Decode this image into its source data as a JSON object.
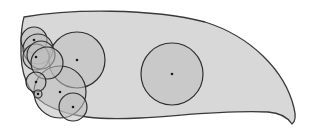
{
  "diagram": {
    "type": "cell-with-vesicles",
    "colors": {
      "background": "#ffffff",
      "body_fill": "#d8d8d8",
      "circle_fill": "#c2c2c2",
      "stroke": "#2e2e2e",
      "dot": "#1a1a1a"
    },
    "body_path": "M24,17 C70,9 150,8 205,22 C250,36 285,70 294,108 C296,116 295,122 292,124 C288,118 282,113 268,112 C220,110 180,116 140,118 C100,120 70,118 45,104 C26,92 20,70 21,45 C21,33 22,24 24,17 Z",
    "circles": [
      {
        "cx": 77,
        "cy": 60,
        "r": 28,
        "dot": true
      },
      {
        "cx": 172,
        "cy": 74,
        "r": 31,
        "dot": true
      },
      {
        "cx": 60,
        "cy": 92,
        "r": 26,
        "dot": true
      },
      {
        "cx": 73,
        "cy": 107,
        "r": 14,
        "dot": true
      },
      {
        "cx": 34,
        "cy": 40,
        "r": 13,
        "dot": true
      },
      {
        "cx": 38,
        "cy": 49,
        "r": 15,
        "dot": false
      },
      {
        "cx": 36,
        "cy": 57,
        "r": 13,
        "dot": true
      },
      {
        "cx": 41,
        "cy": 55,
        "r": 14,
        "dot": false
      },
      {
        "cx": 47,
        "cy": 63,
        "r": 16,
        "dot": false
      },
      {
        "cx": 36,
        "cy": 82,
        "r": 10,
        "dot": true
      },
      {
        "cx": 38,
        "cy": 94,
        "r": 4,
        "dot": true
      }
    ]
  }
}
